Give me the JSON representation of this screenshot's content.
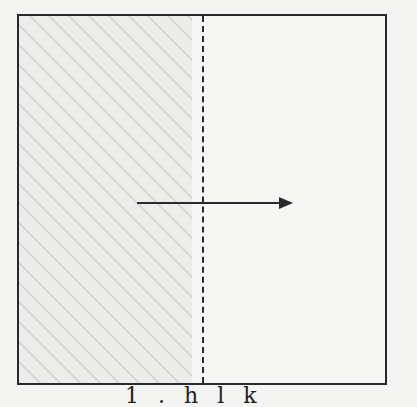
{
  "diagram": {
    "regions": [
      {
        "name": "shaded-left-region",
        "pattern": "diagonal-hatch",
        "color": "#ececea"
      },
      {
        "name": "unshaded-right-region",
        "color": "#f6f6f4"
      }
    ],
    "divider": {
      "style": "dashed",
      "orientation": "vertical"
    },
    "arrow": {
      "direction": "right"
    },
    "caption": "1 . h l k"
  },
  "colors": {
    "line": "#2a2a2a",
    "background": "#f4f4f2"
  }
}
